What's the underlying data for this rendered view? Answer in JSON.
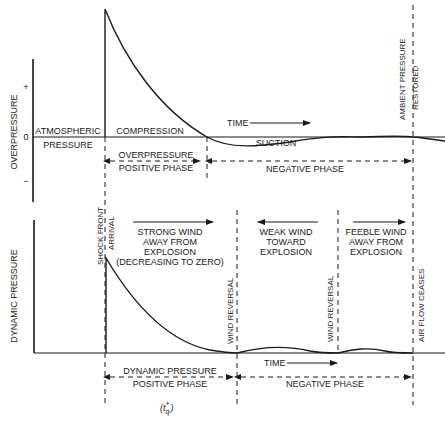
{
  "overpressure_panel": {
    "y_axis_label": "OVERPRESSURE",
    "tick_plus": "+",
    "tick_zero": "0",
    "tick_minus": "−",
    "region_before_label_1": "ATMOSPHERIC",
    "region_before_label_2": "PRESSURE",
    "compression_label": "COMPRESSION",
    "suction_label": "SUCTION",
    "time_label": "TIME",
    "positive_phase_label_1": "OVERPRESSURE",
    "positive_phase_label_2": "POSITIVE PHASE",
    "negative_phase_label": "NEGATIVE PHASE",
    "ambient_label_1": "AMBIENT PRESSURE",
    "ambient_label_2": "RESTORED"
  },
  "shock_front": {
    "label_1": "SHOCK FRONT",
    "label_2": "ARRIVAL"
  },
  "dynamic_panel": {
    "y_axis_label": "DYNAMIC PRESSURE",
    "strong_wind_lines": [
      "STRONG WIND",
      "AWAY FROM",
      "EXPLOSION",
      "(DECREASING TO ZERO)"
    ],
    "weak_wind_lines": [
      "WEAK WIND",
      "TOWARD",
      "EXPLOSION"
    ],
    "feeble_wind_lines": [
      "FEEBLE WIND",
      "AWAY FROM",
      "EXPLOSION"
    ],
    "wind_reversal_1": "WIND REVERSAL",
    "wind_reversal_2": "WIND REVERSAL",
    "air_flow_ceases": "AIR FLOW CEASES",
    "time_label": "TIME",
    "positive_phase_label_1": "DYNAMIC PRESSURE",
    "positive_phase_label_2": "POSITIVE PHASE",
    "negative_phase_label": "NEGATIVE PHASE",
    "duration_symbol": "(t",
    "duration_sub": "q",
    "duration_sup": "+",
    "duration_close": ")"
  },
  "colors": {
    "ink": "#1a1a1a",
    "background": "#ffffff"
  }
}
